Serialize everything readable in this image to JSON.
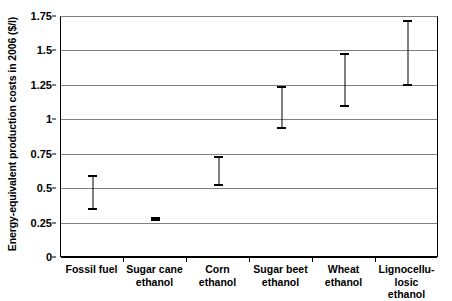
{
  "chart_data": {
    "type": "scatter",
    "title": "",
    "subtitle": "",
    "xlabel": "",
    "ylabel": "Energy-equivalent production costs in 2006 ($/l)",
    "categories": [
      "Fossil fuel",
      "Sugar cane ethanol",
      "Corn ethanol",
      "Sugar beet ethanol",
      "Wheat ethanol",
      "Lignocellulosic ethanol"
    ],
    "category_lines": [
      [
        "Fossil fuel"
      ],
      [
        "Sugar cane",
        "ethanol"
      ],
      [
        "Corn",
        "ethanol"
      ],
      [
        "Sugar beet",
        "ethanol"
      ],
      [
        "Wheat",
        "ethanol"
      ],
      [
        "Lignocellu-",
        "losic ethanol"
      ]
    ],
    "series": [
      {
        "name": "Production cost range",
        "ranges": [
          {
            "category": "Fossil fuel",
            "low": 0.35,
            "high": 0.6
          },
          {
            "category": "Sugar cane ethanol",
            "low": 0.27,
            "high": 0.3
          },
          {
            "category": "Corn ethanol",
            "low": 0.52,
            "high": 0.74
          },
          {
            "category": "Sugar beet ethanol",
            "low": 0.94,
            "high": 1.25
          },
          {
            "category": "Wheat ethanol",
            "low": 1.1,
            "high": 1.49
          },
          {
            "category": "Lignocellulosic ethanol",
            "low": 1.25,
            "high": 1.73
          }
        ]
      }
    ],
    "ylim": [
      0,
      1.75
    ],
    "ytick_values": [
      0,
      0.25,
      0.5,
      0.75,
      1,
      1.25,
      1.5,
      1.75
    ],
    "ytick_labels": [
      "0",
      "0.25",
      "0.5",
      "0.75",
      "1",
      "1.25",
      "1.5",
      "1.75"
    ],
    "grid": true,
    "grid_axis": "y",
    "legend": false,
    "legend_position": "none",
    "colors": {
      "marker": "#000000",
      "gridline": "#808080",
      "axis": "#000000",
      "background": "#ffffff"
    }
  }
}
